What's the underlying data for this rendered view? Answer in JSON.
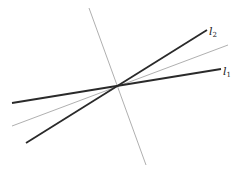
{
  "diagram": {
    "type": "intersecting-lines",
    "intersection_point": [
      117,
      86
    ],
    "lines": [
      {
        "id": "l1",
        "label_main": "l",
        "label_sub": "1",
        "style": "thick",
        "color": "#2a2a2a",
        "from": [
          12,
          103
        ],
        "to": [
          221,
          69
        ],
        "label_pos": [
          223,
          75
        ]
      },
      {
        "id": "l2",
        "label_main": "l",
        "label_sub": "2",
        "style": "thick",
        "color": "#2a2a2a",
        "from": [
          26,
          143
        ],
        "to": [
          207,
          30
        ],
        "label_pos": [
          209,
          35
        ]
      },
      {
        "id": "bisector",
        "style": "thin",
        "color": "#9a9a9a",
        "from": [
          12,
          126
        ],
        "to": [
          228,
          45
        ]
      },
      {
        "id": "perpendicular",
        "style": "thin",
        "color": "#9a9a9a",
        "from": [
          89,
          8
        ],
        "to": [
          146,
          165
        ]
      }
    ]
  }
}
